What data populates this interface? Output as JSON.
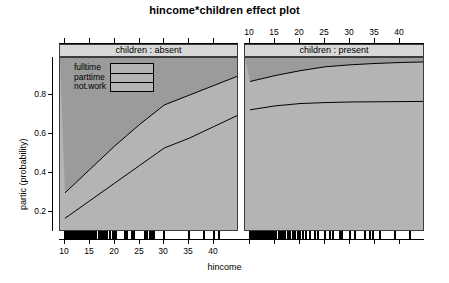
{
  "title": "hincome*children effect plot",
  "axes": {
    "xlabel": "hincome",
    "ylabel": "partic (probability)",
    "y_ticks": [
      "0.2",
      "0.4",
      "0.6",
      "0.8"
    ],
    "y_tick_values": [
      0.2,
      0.4,
      0.6,
      0.8
    ],
    "x_ticks_bottom": [
      "10",
      "15",
      "20",
      "25",
      "30",
      "35",
      "40"
    ],
    "x_ticks_top": [
      "10",
      "15",
      "20",
      "25",
      "30",
      "35",
      "40"
    ],
    "x_tick_values": [
      10,
      15,
      20,
      25,
      30,
      35,
      40
    ]
  },
  "panels": [
    {
      "strip_label": "children : absent"
    },
    {
      "strip_label": "children : present"
    }
  ],
  "legend": {
    "items": [
      {
        "label": "fulltime"
      },
      {
        "label": "parttime"
      },
      {
        "label": "not.work"
      }
    ]
  },
  "colors": {
    "panel_background": "#b4b4b4",
    "panel_upper_band": "#9b9b9b",
    "strip_background": "#d8d8d8",
    "line": "#000000",
    "frame": "#3c3c3c"
  },
  "chart_data": {
    "type": "line",
    "title": "hincome*children effect plot",
    "xlabel": "hincome",
    "ylabel": "partic (probability)",
    "xlim": [
      9,
      45
    ],
    "ylim": [
      0.1,
      0.99
    ],
    "grid": false,
    "legend_position": "top-left-inside-panel-1",
    "conditioning_variable": "children",
    "panels": [
      {
        "name": "children : absent",
        "xlim": [
          9,
          45
        ],
        "series": [
          {
            "name": "fulltime",
            "x": [
              10,
              15,
              20,
              25,
              30,
              35,
              40,
              45
            ],
            "y": [
              0.3,
              0.42,
              0.54,
              0.65,
              0.75,
              0.8,
              0.85,
              0.9
            ]
          },
          {
            "name": "parttime",
            "x": [
              10,
              15,
              20,
              25,
              30,
              35,
              40,
              45
            ],
            "y": [
              0.17,
              0.26,
              0.35,
              0.44,
              0.53,
              0.58,
              0.64,
              0.7
            ]
          }
        ]
      },
      {
        "name": "children : present",
        "xlim": [
          9,
          45
        ],
        "series": [
          {
            "name": "fulltime",
            "x": [
              10,
              15,
              20,
              25,
              30,
              35,
              40,
              45
            ],
            "y": [
              0.87,
              0.9,
              0.925,
              0.945,
              0.955,
              0.962,
              0.967,
              0.97
            ]
          },
          {
            "name": "parttime",
            "x": [
              10,
              15,
              20,
              25,
              30,
              35,
              40,
              45
            ],
            "y": [
              0.725,
              0.745,
              0.757,
              0.762,
              0.765,
              0.766,
              0.767,
              0.768
            ]
          }
        ]
      }
    ]
  },
  "rug": {
    "panel1_x": [
      10,
      10.2,
      10.5,
      10.8,
      11,
      11.3,
      11.6,
      12,
      12.3,
      12.6,
      13,
      13.4,
      13.8,
      14.2,
      14.6,
      15,
      15.4,
      15.9,
      16.3,
      16.8,
      17.2,
      17.6,
      18,
      18.5,
      19,
      19.6,
      20,
      20.3,
      22,
      22.4,
      23.5,
      23.9,
      26,
      26.5,
      27,
      27.5,
      28,
      30,
      35,
      38,
      40,
      41
    ],
    "panel2_x": [
      10,
      10.3,
      10.6,
      11,
      11.3,
      11.7,
      12,
      12.4,
      12.8,
      13.2,
      13.6,
      14,
      14.4,
      14.8,
      15.2,
      15.7,
      16.1,
      16.6,
      17,
      17.5,
      18,
      18.5,
      19,
      19.5,
      20,
      20.6,
      21.2,
      22,
      23,
      23.6,
      25,
      26,
      26.6,
      28,
      28.4,
      30,
      31,
      33,
      34,
      34.6,
      36,
      39,
      42
    ]
  }
}
